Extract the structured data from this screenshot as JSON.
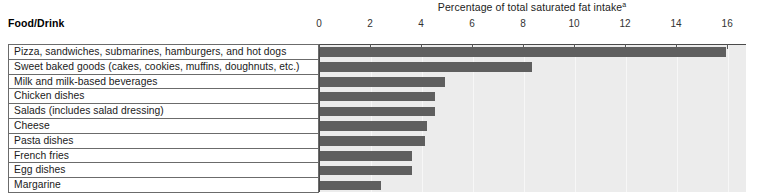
{
  "table": {
    "column_header": "Food/Drink"
  },
  "chart_data": {
    "type": "bar",
    "orientation": "horizontal",
    "title": "Percentage of total saturated fat intake",
    "title_footnote_marker": "a",
    "xlabel": "",
    "ylabel": "Food/Drink",
    "xlim": [
      0,
      16.7
    ],
    "grid": true,
    "legend": "none",
    "tick_labels": [
      "0",
      "2",
      "4",
      "6",
      "8",
      "10",
      "12",
      "14",
      "16"
    ],
    "tick_values": [
      0,
      2,
      4,
      6,
      8,
      10,
      12,
      14,
      16
    ],
    "categories": [
      "Pizza, sandwiches, submarines, hamburgers, and hot dogs",
      "Sweet baked goods (cakes, cookies, muffins, doughnuts, etc.)",
      "Milk and milk-based beverages",
      "Chicken dishes",
      "Salads (includes salad dressing)",
      "Cheese",
      "Pasta dishes",
      "French fries",
      "Egg dishes",
      "Margarine"
    ],
    "values": [
      15.9,
      8.3,
      4.9,
      4.5,
      4.5,
      4.2,
      4.1,
      3.6,
      3.6,
      2.4
    ],
    "bar_color": "#5f5f5f",
    "plot_background": "#ececec"
  }
}
